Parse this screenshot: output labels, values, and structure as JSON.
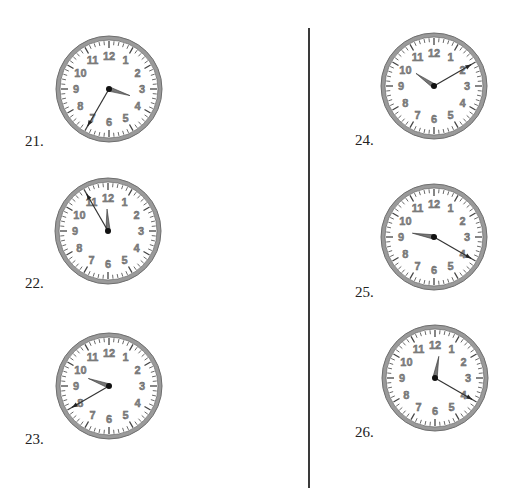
{
  "worksheet": {
    "clocks": [
      {
        "label": "21.",
        "hour": 3,
        "minute": 35,
        "cx": 109,
        "cy": 89,
        "label_x": 25,
        "label_y": 134
      },
      {
        "label": "22.",
        "hour": 11,
        "minute": 55,
        "cx": 108,
        "cy": 231,
        "label_x": 25,
        "label_y": 276
      },
      {
        "label": "23.",
        "hour": 9,
        "minute": 40,
        "cx": 109,
        "cy": 386,
        "label_x": 25,
        "label_y": 432
      },
      {
        "label": "24.",
        "hour": 10,
        "minute": 10,
        "cx": 434,
        "cy": 86,
        "label_x": 355,
        "label_y": 133
      },
      {
        "label": "25.",
        "hour": 9,
        "minute": 20,
        "cx": 434,
        "cy": 237,
        "label_x": 355,
        "label_y": 285
      },
      {
        "label": "26.",
        "hour": 12,
        "minute": 20,
        "cx": 435,
        "cy": 378,
        "label_x": 355,
        "label_y": 425
      }
    ],
    "dial_numbers": [
      "12",
      "1",
      "2",
      "3",
      "4",
      "5",
      "6",
      "7",
      "8",
      "9",
      "10",
      "11"
    ],
    "colors": {
      "rim": "#9a9a9a",
      "rim_dark": "#6e6e6e",
      "face": "#ffffff",
      "hand": "#555555",
      "center": "#111111",
      "divider": "#3a3a3a"
    }
  }
}
